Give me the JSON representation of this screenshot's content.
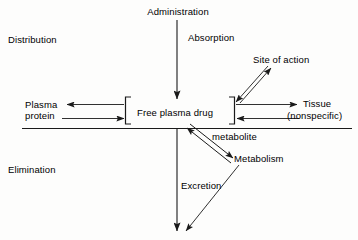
{
  "diagram": {
    "background_color": "#fdfdfc",
    "line_color": "#1a1a1a",
    "text_color": "#000000",
    "sections": {
      "upper_label": "Distribution",
      "lower_label": "Elimination"
    },
    "nodes": {
      "administration": "Administration",
      "absorption": "Absorption",
      "site_of_action": "Site of action",
      "plasma_protein_line1": "Plasma",
      "plasma_protein_line2": "protein",
      "free_plasma_drug": "Free plasma drug",
      "tissue_line1": "Tissue",
      "tissue_line2": "(nonspecific)",
      "metabolite": "metabolite",
      "metabolism": "Metabolism",
      "excretion": "Excretion"
    },
    "connections": [
      {
        "name": "administration-to-drug",
        "label": "Absorption",
        "direction": "down",
        "style": "single"
      },
      {
        "name": "drug-to-plasma-protein",
        "label": "Plasma protein",
        "direction": "bidirectional",
        "style": "double"
      },
      {
        "name": "drug-to-site-of-action",
        "label": "Site of action",
        "direction": "bidirectional",
        "style": "double-diagonal"
      },
      {
        "name": "drug-to-tissue",
        "label": "Tissue (nonspecific)",
        "direction": "bidirectional",
        "style": "double"
      },
      {
        "name": "drug-to-metabolism",
        "label": "metabolite",
        "direction": "bidirectional",
        "style": "double-diagonal"
      },
      {
        "name": "drug-to-excretion",
        "label": "Excretion",
        "direction": "down",
        "style": "single"
      },
      {
        "name": "metabolism-to-excretion",
        "label": "",
        "direction": "down",
        "style": "single-diagonal"
      }
    ]
  }
}
